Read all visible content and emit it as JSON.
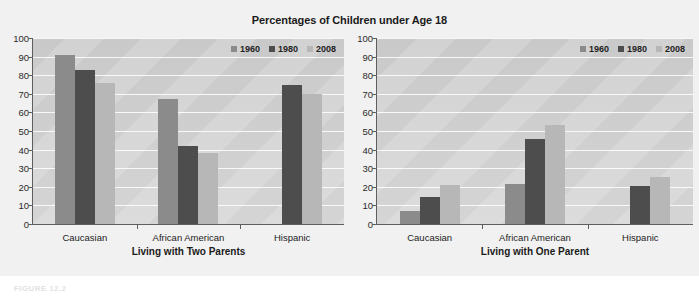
{
  "figure": {
    "title": "Percentages of Children under Age 18",
    "caption": "FIGURE 12.2"
  },
  "legend": {
    "position": "top-right",
    "entries": [
      {
        "label": "1960",
        "color": "#8b8b8b"
      },
      {
        "label": "1980",
        "color": "#4d4d4d"
      },
      {
        "label": "2008",
        "color": "#b7b7b7"
      }
    ]
  },
  "y_axis": {
    "ticks": [
      "0",
      "10",
      "20",
      "30",
      "40",
      "50",
      "60",
      "70",
      "80",
      "90",
      "100"
    ],
    "min": 0,
    "max": 100
  },
  "chart_data": [
    {
      "type": "bar",
      "title": "Percentages of Children under Age 18",
      "panel": "left",
      "xlabel": "Living with Two Parents",
      "ylabel": "",
      "ylim": [
        0,
        100
      ],
      "grid": true,
      "legend_position": "top-right",
      "categories": [
        "Caucasian",
        "African American",
        "Hispanic"
      ],
      "series": [
        {
          "name": "1960",
          "color": "#8b8b8b",
          "values": [
            91,
            67,
            null
          ]
        },
        {
          "name": "1980",
          "color": "#4d4d4d",
          "values": [
            83,
            42,
            75
          ]
        },
        {
          "name": "2008",
          "color": "#b7b7b7",
          "values": [
            76,
            38,
            70
          ]
        }
      ]
    },
    {
      "type": "bar",
      "title": "Percentages of Children under Age 18",
      "panel": "right",
      "xlabel": "Living with One Parent",
      "ylabel": "",
      "ylim": [
        0,
        100
      ],
      "grid": true,
      "legend_position": "top-right",
      "categories": [
        "Caucasian",
        "African American",
        "Hispanic"
      ],
      "series": [
        {
          "name": "1960",
          "color": "#8b8b8b",
          "values": [
            7,
            21.5,
            null
          ]
        },
        {
          "name": "1980",
          "color": "#4d4d4d",
          "values": [
            14.5,
            45.5,
            20.5
          ]
        },
        {
          "name": "2008",
          "color": "#b7b7b7",
          "values": [
            21,
            53,
            25.5
          ]
        }
      ]
    }
  ]
}
